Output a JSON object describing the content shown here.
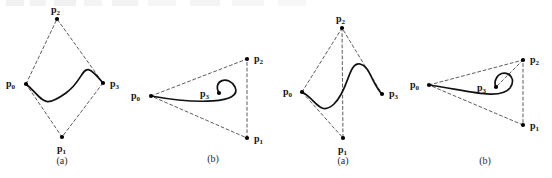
{
  "figure": {
    "background": "#ffffff",
    "curve_color": "#111111",
    "hull_color": "#4a4a4a",
    "point_color": "#000000",
    "label_color": "#141414"
  },
  "labels": {
    "p0": "p",
    "p1": "p",
    "p2": "p",
    "p3": "p",
    "sub0": "0",
    "sub1": "1",
    "sub2": "2",
    "sub3": "3"
  },
  "panels": [
    {
      "id": "panel-1",
      "caption": "(a)",
      "caption_xy": [
        62,
        164
      ],
      "points": [
        {
          "name": "p0",
          "label": "p",
          "sub": "0",
          "x": 26,
          "y": 84,
          "label_x": 6,
          "label_y": 87
        },
        {
          "name": "p1",
          "label": "p",
          "sub": "1",
          "x": 62,
          "y": 137,
          "label_x": 57,
          "label_y": 152
        },
        {
          "name": "p2",
          "label": "p",
          "sub": "2",
          "x": 57,
          "y": 19,
          "label_x": 51,
          "label_y": 13
        },
        {
          "name": "p3",
          "label": "p",
          "sub": "3",
          "x": 103,
          "y": 83,
          "label_x": 110,
          "label_y": 87
        }
      ],
      "hull_path": "M 26 84 L 57 19 L 103 83 L 62 137 Z",
      "curve_path": "M 26 84 C 44 99 42 110 66 93 C 88 77 80 55 103 83"
    },
    {
      "id": "panel-2",
      "caption": "(b)",
      "caption_xy": [
        213,
        162
      ],
      "points": [
        {
          "name": "p0",
          "label": "p",
          "sub": "0",
          "x": 151,
          "y": 96,
          "label_x": 131,
          "label_y": 99
        },
        {
          "name": "p1",
          "label": "p",
          "sub": "1",
          "x": 247,
          "y": 138,
          "label_x": 254,
          "label_y": 142
        },
        {
          "name": "p2",
          "label": "p",
          "sub": "2",
          "x": 247,
          "y": 59,
          "label_x": 254,
          "label_y": 62
        },
        {
          "name": "p3",
          "label": "p",
          "sub": "3",
          "x": 219,
          "y": 93,
          "label_x": 200,
          "label_y": 97
        }
      ],
      "hull_path": "M 151 96 L 247 59 L 247 138 Z",
      "curve_path": "M 151 96 C 196 104 243 104 235 87 C 229 75 212 80 219 93"
    },
    {
      "id": "panel-3",
      "caption": "(a)",
      "caption_xy": [
        343,
        164
      ],
      "points": [
        {
          "name": "p0",
          "label": "p",
          "sub": "0",
          "x": 302,
          "y": 92,
          "label_x": 283,
          "label_y": 95
        },
        {
          "name": "p1",
          "label": "p",
          "sub": "1",
          "x": 343,
          "y": 138,
          "label_x": 338,
          "label_y": 153
        },
        {
          "name": "p2",
          "label": "p",
          "sub": "2",
          "x": 342,
          "y": 28,
          "label_x": 336,
          "label_y": 22
        },
        {
          "name": "p3",
          "label": "p",
          "sub": "3",
          "x": 382,
          "y": 94,
          "label_x": 389,
          "label_y": 97
        }
      ],
      "hull_path": "M 302 92 L 342 28 L 382 94 M 342 28 L 343 138 L 302 92",
      "curve_path": "M 302 92 C 316 99 320 117 334 104 C 349 90 348 62 360 64 C 370 66 372 84 382 94"
    },
    {
      "id": "panel-4",
      "caption": "(b)",
      "caption_xy": [
        485,
        164
      ],
      "points": [
        {
          "name": "p0",
          "label": "p",
          "sub": "0",
          "x": 429,
          "y": 85,
          "label_x": 410,
          "label_y": 88
        },
        {
          "name": "p1",
          "label": "p",
          "sub": "1",
          "x": 523,
          "y": 125,
          "label_x": 530,
          "label_y": 129
        },
        {
          "name": "p2",
          "label": "p",
          "sub": "2",
          "x": 523,
          "y": 60,
          "label_x": 530,
          "label_y": 63
        },
        {
          "name": "p3",
          "label": "p",
          "sub": "3",
          "x": 496,
          "y": 87,
          "label_x": 477,
          "label_y": 91
        },
        {
          "name": "p3b",
          "label": "p",
          "sub": "3",
          "x": 146,
          "y": 84,
          "label_x": 152,
          "label_y": 88
        }
      ],
      "hull_path": "M 429 85 L 523 60 L 523 125 Z M 523 60 L 496 87",
      "curve_path": "M 429 85 C 466 90 500 101 510 88 C 519 75 501 67 496 79 C 494 83 495 85 496 87"
    }
  ],
  "stray_labels": [
    {
      "name": "stray-p3-left",
      "label": "p",
      "sub": "3",
      "x": 111,
      "y": 87
    }
  ]
}
